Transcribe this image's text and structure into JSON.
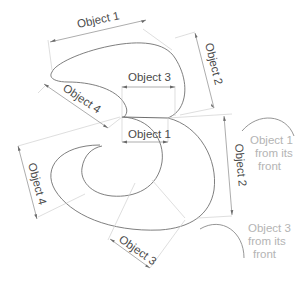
{
  "diagram": {
    "dimension_labels": {
      "top_width": "Object 1",
      "top_right_height": "Object 2",
      "top_inner_width": "Object 3",
      "top_left_diag": "Object 4",
      "middle_width": "Object 1",
      "bottom_right_height": "Object 2",
      "bottom_left_height": "Object 4",
      "bottom_diag": "Object 3"
    },
    "side_views": [
      {
        "line1": "Object 1",
        "line2": "from its",
        "line3": "front"
      },
      {
        "line1": "Object 3",
        "line2": "from its",
        "line3": "front"
      }
    ],
    "colors": {
      "outline": "#707070",
      "dimension": "#8a8a8a",
      "label": "#4a4a4a",
      "side_label": "#b4b4b4"
    }
  }
}
